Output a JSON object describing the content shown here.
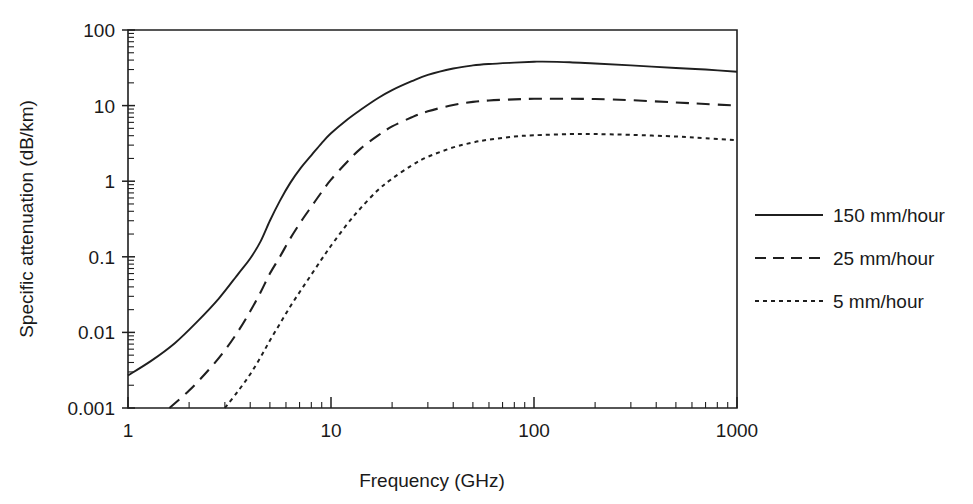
{
  "chart_data": {
    "type": "line",
    "title": "",
    "xlabel": "Frequency (GHz)",
    "ylabel": "Specific attenuation (dB/km)",
    "xscale": "log",
    "yscale": "log",
    "xlim": [
      1,
      1000
    ],
    "ylim": [
      0.001,
      100
    ],
    "grid": false,
    "legend_position": "right",
    "xticks": [
      {
        "value": 1,
        "label": "1"
      },
      {
        "value": 10,
        "label": "10"
      },
      {
        "value": 100,
        "label": "100"
      },
      {
        "value": 1000,
        "label": "1000"
      }
    ],
    "yticks": [
      {
        "value": 100,
        "label": "100"
      },
      {
        "value": 10,
        "label": "10"
      },
      {
        "value": 1,
        "label": "1"
      },
      {
        "value": 0.1,
        "label": "0.1"
      },
      {
        "value": 0.01,
        "label": "0.01"
      },
      {
        "value": 0.001,
        "label": "0.001"
      }
    ],
    "series": [
      {
        "name": "150 mm/hour",
        "style": "solid",
        "color": "#1f1f1f",
        "x": [
          1,
          1.3,
          1.7,
          2.2,
          2.8,
          3.5,
          4,
          4.5,
          5,
          5.6,
          6.3,
          7.1,
          8,
          9,
          10,
          12,
          14,
          17,
          20,
          25,
          30,
          40,
          50,
          60,
          80,
          100,
          110,
          150,
          200,
          300,
          500,
          700,
          1000
        ],
        "y": [
          0.0027,
          0.0042,
          0.0072,
          0.014,
          0.028,
          0.06,
          0.095,
          0.16,
          0.3,
          0.55,
          0.95,
          1.5,
          2.2,
          3.2,
          4.3,
          6.5,
          8.8,
          12.5,
          16,
          21,
          25.5,
          31,
          34,
          35.5,
          37,
          38,
          38.2,
          37.5,
          36,
          34,
          31.5,
          30,
          28
        ]
      },
      {
        "name": "25 mm/hour",
        "style": "dashed",
        "color": "#1f1f1f",
        "x": [
          1.6,
          2,
          2.5,
          3,
          3.5,
          4,
          4.5,
          5,
          5.6,
          6.3,
          7.1,
          8,
          9,
          10,
          12,
          14,
          17,
          20,
          25,
          30,
          40,
          50,
          60,
          80,
          100,
          150,
          200,
          300,
          500,
          700,
          1000
        ],
        "y": [
          0.001,
          0.0017,
          0.0032,
          0.0058,
          0.0105,
          0.019,
          0.034,
          0.06,
          0.1,
          0.175,
          0.29,
          0.46,
          0.72,
          1.05,
          1.8,
          2.7,
          4.0,
          5.3,
          7.0,
          8.4,
          10.2,
          11.2,
          11.7,
          12.1,
          12.3,
          12.3,
          12.2,
          11.8,
          11.0,
          10.5,
          10.0
        ]
      },
      {
        "name": "5 mm/hour",
        "style": "dotted",
        "color": "#1f1f1f",
        "x": [
          3,
          3.5,
          4,
          4.5,
          5,
          5.6,
          6.3,
          7.1,
          8,
          9,
          10,
          12,
          14,
          17,
          20,
          25,
          30,
          40,
          50,
          60,
          80,
          100,
          150,
          200,
          300,
          500,
          700,
          1000
        ],
        "y": [
          0.001,
          0.0017,
          0.0028,
          0.0047,
          0.0078,
          0.013,
          0.022,
          0.036,
          0.058,
          0.093,
          0.14,
          0.27,
          0.44,
          0.76,
          1.08,
          1.62,
          2.1,
          2.8,
          3.25,
          3.55,
          3.9,
          4.05,
          4.2,
          4.2,
          4.1,
          3.9,
          3.7,
          3.5
        ]
      }
    ],
    "legend": [
      {
        "label": "150 mm/hour",
        "style": "solid"
      },
      {
        "label": "25 mm/hour",
        "style": "dashed"
      },
      {
        "label": "5 mm/hour",
        "style": "dotted"
      }
    ]
  }
}
